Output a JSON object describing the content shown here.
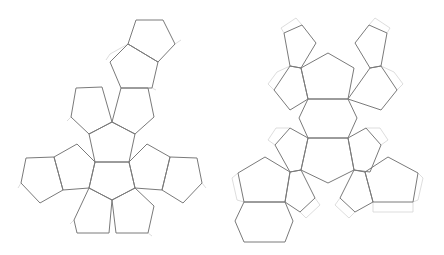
{
  "diagram": {
    "title": "",
    "background": "#ffffff",
    "face_stroke": "#7a7a7a",
    "tab_stroke": "#d4d4d4"
  },
  "nets": [
    {
      "name": "dodecahedron-net-left",
      "faces": [
        [
          [
            136,
            20
          ],
          [
            163,
            20
          ],
          [
            175,
            44
          ],
          [
            158,
            62
          ],
          [
            128,
            44
          ]
        ],
        [
          [
            128,
            44
          ],
          [
            158,
            62
          ],
          [
            152,
            88
          ],
          [
            121,
            88
          ],
          [
            110,
            62
          ]
        ],
        [
          [
            121,
            88
          ],
          [
            148,
            88
          ],
          [
            154,
            117
          ],
          [
            135,
            134
          ],
          [
            112,
            122
          ]
        ],
        [
          [
            76,
            88
          ],
          [
            102,
            87
          ],
          [
            112,
            122
          ],
          [
            89,
            134
          ],
          [
            71,
            117
          ]
        ],
        [
          [
            112,
            122
          ],
          [
            135,
            134
          ],
          [
            129,
            162
          ],
          [
            95,
            162
          ],
          [
            89,
            134
          ]
        ],
        [
          [
            95,
            162
          ],
          [
            129,
            162
          ],
          [
            135,
            188
          ],
          [
            112,
            200
          ],
          [
            89,
            188
          ]
        ],
        [
          [
            54,
            157
          ],
          [
            77,
            144
          ],
          [
            95,
            162
          ],
          [
            89,
            188
          ],
          [
            63,
            190
          ]
        ],
        [
          [
            26,
            158
          ],
          [
            54,
            157
          ],
          [
            63,
            190
          ],
          [
            40,
            203
          ],
          [
            21,
            183
          ]
        ],
        [
          [
            129,
            162
          ],
          [
            147,
            144
          ],
          [
            170,
            157
          ],
          [
            162,
            190
          ],
          [
            135,
            188
          ]
        ],
        [
          [
            170,
            157
          ],
          [
            197,
            158
          ],
          [
            202,
            183
          ],
          [
            183,
            203
          ],
          [
            162,
            190
          ]
        ],
        [
          [
            74,
            220
          ],
          [
            89,
            188
          ],
          [
            112,
            200
          ],
          [
            109,
            233
          ],
          [
            77,
            233
          ]
        ],
        [
          [
            112,
            200
          ],
          [
            135,
            188
          ],
          [
            154,
            206
          ],
          [
            148,
            233
          ],
          [
            116,
            233
          ]
        ]
      ],
      "tabs": [
        [
          [
            128,
            44
          ],
          [
            110,
            54
          ],
          [
            106,
            60
          ]
        ],
        [
          [
            175,
            44
          ],
          [
            181,
            40
          ]
        ],
        [
          [
            152,
            88
          ],
          [
            156,
            90
          ]
        ],
        [
          [
            71,
            117
          ],
          [
            67,
            121
          ]
        ],
        [
          [
            21,
            183
          ],
          [
            18,
            188
          ]
        ],
        [
          [
            202,
            183
          ],
          [
            206,
            188
          ]
        ],
        [
          [
            74,
            220
          ],
          [
            70,
            224
          ]
        ],
        [
          [
            148,
            233
          ],
          [
            152,
            236
          ]
        ]
      ]
    },
    {
      "name": "dodecahedron-net-right",
      "faces": [
        [
          [
            284,
            33
          ],
          [
            302,
            25
          ],
          [
            316,
            43
          ],
          [
            301,
            68
          ],
          [
            290,
            66
          ]
        ],
        [
          [
            355,
            43
          ],
          [
            369,
            25
          ],
          [
            387,
            33
          ],
          [
            381,
            66
          ],
          [
            370,
            68
          ]
        ],
        [
          [
            328,
            53
          ],
          [
            354,
            68
          ],
          [
            348,
            99
          ],
          [
            308,
            99
          ],
          [
            301,
            68
          ]
        ],
        [
          [
            290,
            66
          ],
          [
            301,
            68
          ],
          [
            308,
            99
          ],
          [
            290,
            110
          ],
          [
            274,
            90
          ]
        ],
        [
          [
            370,
            68
          ],
          [
            381,
            66
          ],
          [
            397,
            90
          ],
          [
            381,
            110
          ],
          [
            348,
            99
          ]
        ],
        [
          [
            308,
            99
          ],
          [
            348,
            99
          ],
          [
            357,
            118
          ],
          [
            348,
            138
          ],
          [
            308,
            138
          ],
          [
            299,
            118
          ]
        ],
        [
          [
            308,
            138
          ],
          [
            348,
            138
          ],
          [
            354,
            170
          ],
          [
            328,
            183
          ],
          [
            301,
            170
          ]
        ],
        [
          [
            275,
            145
          ],
          [
            290,
            128
          ],
          [
            308,
            138
          ],
          [
            301,
            170
          ],
          [
            290,
            172
          ]
        ],
        [
          [
            348,
            138
          ],
          [
            366,
            128
          ],
          [
            381,
            145
          ],
          [
            370,
            172
          ],
          [
            354,
            170
          ]
        ],
        [
          [
            238,
            173
          ],
          [
            265,
            157
          ],
          [
            290,
            172
          ],
          [
            285,
            202
          ],
          [
            244,
            202
          ]
        ],
        [
          [
            244,
            202
          ],
          [
            285,
            202
          ],
          [
            293,
            221
          ],
          [
            285,
            242
          ],
          [
            244,
            242
          ],
          [
            235,
            221
          ]
        ],
        [
          [
            290,
            172
          ],
          [
            301,
            170
          ],
          [
            315,
            198
          ],
          [
            300,
            212
          ],
          [
            285,
            202
          ]
        ],
        [
          [
            354,
            170
          ],
          [
            365,
            172
          ],
          [
            373,
            202
          ],
          [
            355,
            212
          ],
          [
            340,
            198
          ]
        ],
        [
          [
            365,
            172
          ],
          [
            388,
            157
          ],
          [
            418,
            173
          ],
          [
            413,
            202
          ],
          [
            373,
            202
          ]
        ]
      ],
      "tabs": [
        [
          [
            284,
            33
          ],
          [
            281,
            28
          ],
          [
            296,
            18
          ],
          [
            302,
            25
          ]
        ],
        [
          [
            387,
            33
          ],
          [
            390,
            28
          ],
          [
            375,
            18
          ],
          [
            369,
            25
          ]
        ],
        [
          [
            274,
            90
          ],
          [
            268,
            84
          ],
          [
            277,
            72
          ],
          [
            290,
            66
          ]
        ],
        [
          [
            397,
            90
          ],
          [
            403,
            84
          ],
          [
            394,
            72
          ],
          [
            381,
            66
          ]
        ],
        [
          [
            275,
            145
          ],
          [
            268,
            140
          ],
          [
            276,
            128
          ],
          [
            290,
            128
          ]
        ],
        [
          [
            381,
            145
          ],
          [
            388,
            140
          ],
          [
            380,
            128
          ],
          [
            366,
            128
          ]
        ],
        [
          [
            238,
            173
          ],
          [
            232,
            178
          ],
          [
            237,
            200
          ],
          [
            244,
            202
          ]
        ],
        [
          [
            418,
            173
          ],
          [
            423,
            178
          ],
          [
            418,
            200
          ],
          [
            413,
            202
          ]
        ],
        [
          [
            315,
            198
          ],
          [
            320,
            205
          ],
          [
            306,
            218
          ],
          [
            300,
            212
          ]
        ],
        [
          [
            340,
            198
          ],
          [
            335,
            205
          ],
          [
            349,
            218
          ],
          [
            355,
            212
          ]
        ],
        [
          [
            373,
            202
          ],
          [
            373,
            212
          ],
          [
            413,
            212
          ],
          [
            413,
            202
          ]
        ]
      ]
    }
  ]
}
